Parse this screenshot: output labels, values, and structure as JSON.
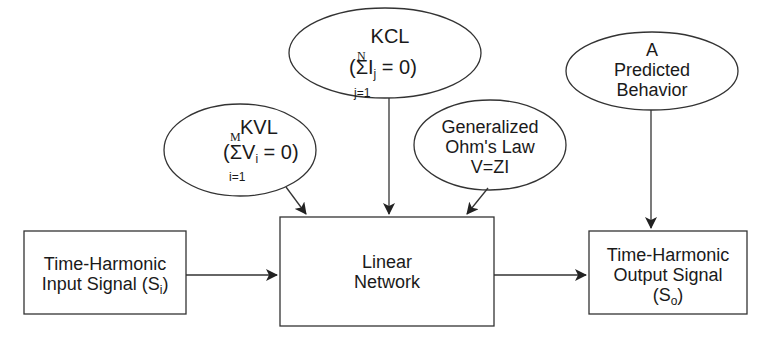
{
  "diagram": {
    "nodes": {
      "kcl": {
        "title": "KCL",
        "open": "(",
        "sigma": "Σ",
        "var": "I",
        "sub": "j",
        "rest": " = 0)",
        "upper": "N",
        "lower": "j=1"
      },
      "kvl": {
        "title": "KVL",
        "open": "(",
        "sigma": "Σ",
        "var": "V",
        "sub": "i",
        "rest": " = 0)",
        "upper": "M",
        "lower": "i=1"
      },
      "ohm": {
        "line1": "Generalized",
        "line2": "Ohm's Law",
        "line3": "V=ZI"
      },
      "predicted": {
        "line1": "A",
        "line2": "Predicted",
        "line3": "Behavior"
      },
      "input": {
        "line1": "Time-Harmonic",
        "line2": "Input Signal (S",
        "sub": "i",
        "close": ")"
      },
      "network": {
        "line1": "Linear",
        "line2": "Network"
      },
      "output": {
        "line1": "Time-Harmonic",
        "line2": "Output Signal",
        "line3": "(S",
        "sub": "o",
        "close": ")"
      }
    },
    "edges": [
      {
        "from": "kvl",
        "to": "network"
      },
      {
        "from": "kcl",
        "to": "network"
      },
      {
        "from": "ohm",
        "to": "network"
      },
      {
        "from": "input",
        "to": "network"
      },
      {
        "from": "network",
        "to": "output"
      },
      {
        "from": "predicted",
        "to": "output"
      }
    ],
    "colors": {
      "stroke": "#333333",
      "background": "#ffffff",
      "text": "#1a1a1a"
    }
  }
}
